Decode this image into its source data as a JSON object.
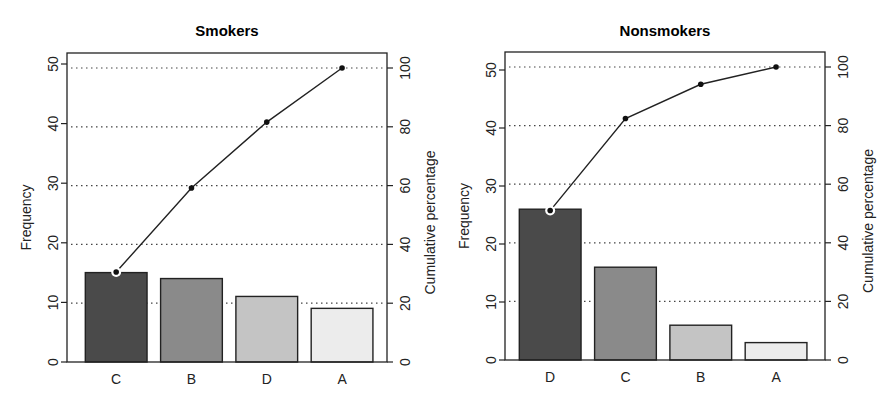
{
  "chart_data": [
    {
      "type": "bar",
      "subtype": "pareto",
      "title": "Smokers",
      "xlabel": "",
      "ylabel": "Frequency",
      "y2label": "Cumulative percentage",
      "categories": [
        "C",
        "B",
        "D",
        "A"
      ],
      "series": [
        {
          "name": "Frequency",
          "type": "bar",
          "values": [
            15,
            14,
            11,
            9
          ]
        },
        {
          "name": "Cumulative percentage",
          "type": "line",
          "axis": "right",
          "values": [
            30.6,
            59.2,
            81.6,
            100
          ]
        }
      ],
      "ylim": [
        0,
        50
      ],
      "y2lim": [
        0,
        100
      ],
      "yticks": [
        0,
        10,
        20,
        30,
        40,
        50
      ],
      "y2ticks": [
        0,
        20,
        40,
        60,
        80,
        100
      ],
      "grid": "dotted horizontal at right-axis ticks",
      "bar_colors": [
        "#4a4a4a",
        "#8a8a8a",
        "#c4c4c4",
        "#ececec"
      ]
    },
    {
      "type": "bar",
      "subtype": "pareto",
      "title": "Nonsmokers",
      "xlabel": "",
      "ylabel": "Frequency",
      "y2label": "Cumulative percentage",
      "categories": [
        "D",
        "C",
        "B",
        "A"
      ],
      "series": [
        {
          "name": "Frequency",
          "type": "bar",
          "values": [
            26,
            16,
            6,
            3
          ]
        },
        {
          "name": "Cumulative percentage",
          "type": "line",
          "axis": "right",
          "values": [
            51.0,
            82.4,
            94.1,
            100
          ]
        }
      ],
      "ylim": [
        0,
        50
      ],
      "y2lim": [
        0,
        100
      ],
      "yticks": [
        0,
        10,
        20,
        30,
        40,
        50
      ],
      "y2ticks": [
        0,
        20,
        40,
        60,
        80,
        100
      ],
      "grid": "dotted horizontal at right-axis ticks",
      "bar_colors": [
        "#4a4a4a",
        "#8a8a8a",
        "#c4c4c4",
        "#ececec"
      ]
    }
  ]
}
